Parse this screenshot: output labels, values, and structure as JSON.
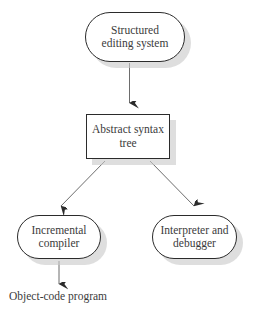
{
  "diagram": {
    "background_color": "#ffffff",
    "stroke_color": "#2b2b2b",
    "text_color": "#3b3b3b",
    "shadow_color": "#c9c9c9",
    "nodes": [
      {
        "id": "structured-editing-system",
        "shape": "stadium",
        "label": "Structured editing system",
        "line1": "Structured",
        "line2": "editing system"
      },
      {
        "id": "abstract-syntax-tree",
        "shape": "rectangle",
        "label": "Abstract syntax tree",
        "line1": "Abstract syntax",
        "line2": "tree"
      },
      {
        "id": "incremental-compiler",
        "shape": "stadium",
        "label": "Incremental compiler",
        "line1": "Incremental",
        "line2": "compiler"
      },
      {
        "id": "interpreter-and-debugger",
        "shape": "stadium",
        "label": "Interpreter and debugger",
        "line1": "Interpreter and",
        "line2": "debugger"
      }
    ],
    "plain_labels": [
      {
        "id": "object-code-program",
        "text": "Object-code program"
      }
    ],
    "edges": [
      {
        "id": "edge-editor-to-ast",
        "from": "structured-editing-system",
        "to": "abstract-syntax-tree",
        "direction": "down",
        "arrowhead": "filled-v"
      },
      {
        "id": "edge-ast-to-compiler",
        "from": "abstract-syntax-tree",
        "to": "incremental-compiler",
        "direction": "down-left",
        "arrowhead": "filled-v"
      },
      {
        "id": "edge-ast-to-interpreter",
        "from": "abstract-syntax-tree",
        "to": "interpreter-and-debugger",
        "direction": "down-right",
        "arrowhead": "filled-v"
      },
      {
        "id": "edge-compiler-to-object-code",
        "from": "incremental-compiler",
        "to": "object-code-program",
        "direction": "down",
        "arrowhead": "filled-v"
      }
    ]
  }
}
